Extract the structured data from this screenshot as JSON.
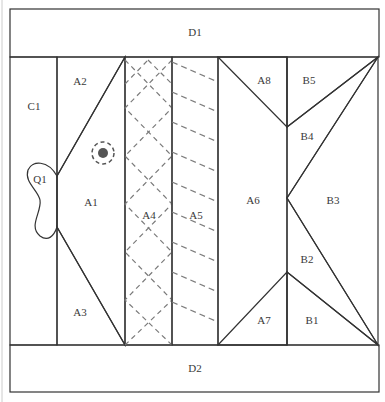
{
  "diagram": {
    "colors": {
      "background": "#d4d4d4",
      "light": "#efefef",
      "medium": "#c9c9c9",
      "dark": "#a6a6a6",
      "stroke": "#333333",
      "quilting_dash": "#7a7a7a"
    },
    "pieces": {
      "D1": "D1",
      "D2": "D2",
      "C1": "C1",
      "Q1": "Q1",
      "A1": "A1",
      "A2": "A2",
      "A3": "A3",
      "A4": "A4",
      "A5": "A5",
      "A6": "A6",
      "A7": "A7",
      "A8": "A8",
      "B1": "B1",
      "B2": "B2",
      "B3": "B3",
      "B4": "B4",
      "B5": "B5"
    },
    "eye": {
      "cx": 103,
      "cy": 153,
      "ring_r": 11,
      "dot_r": 5
    }
  }
}
